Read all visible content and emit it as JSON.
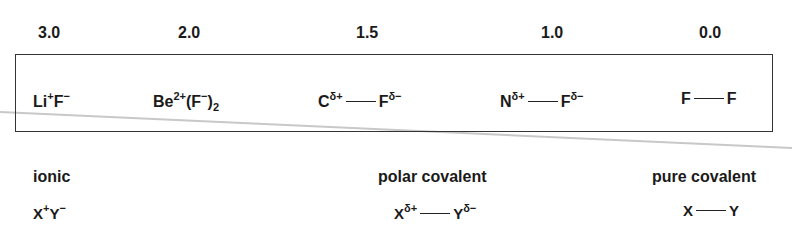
{
  "scale": {
    "values": [
      "3.0",
      "2.0",
      "1.5",
      "1.0",
      "0.0"
    ]
  },
  "molecules": [
    {
      "id": "lif",
      "a": "Li",
      "a_sup": "+",
      "b": "F",
      "b_sup": "−"
    },
    {
      "id": "bef2",
      "a": "Be",
      "a_sup": "2+",
      "paren_open": "(",
      "b": "F",
      "b_sup": "−",
      "paren_close": ")",
      "sub": "2"
    },
    {
      "id": "cf",
      "a": "C",
      "a_sup": "δ+",
      "b": "F",
      "b_sup": "δ−"
    },
    {
      "id": "nf",
      "a": "N",
      "a_sup": "δ+",
      "b": "F",
      "b_sup": "δ−"
    },
    {
      "id": "ff",
      "a": "F",
      "b": "F"
    }
  ],
  "categories": [
    {
      "label": "ionic",
      "x": "X",
      "x_sup": "+",
      "y": "Y",
      "y_sup": "−"
    },
    {
      "label": "polar covalent",
      "x": "X",
      "x_sup": "δ+",
      "y": "Y",
      "y_sup": "δ−"
    },
    {
      "label": "pure covalent",
      "x": "X",
      "y": "Y"
    }
  ]
}
